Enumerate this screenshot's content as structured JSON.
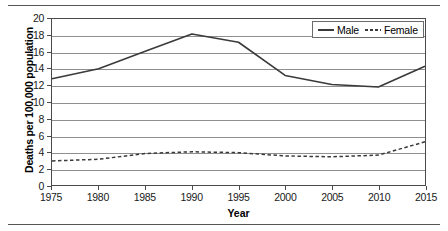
{
  "page": {
    "top_rule": "",
    "bottom_rule": ""
  },
  "chart_data": {
    "type": "line",
    "title": "",
    "xlabel": "Year",
    "ylabel": "Deaths per 100,000 population",
    "xlim": [
      1975,
      2015
    ],
    "ylim": [
      0,
      20
    ],
    "ytick_step": 2,
    "xtick_step": 5,
    "grid": true,
    "legend_position": "top-right",
    "ticks": {
      "y": [
        "0",
        "2",
        "4",
        "6",
        "8",
        "10",
        "12",
        "14",
        "16",
        "18",
        "20"
      ],
      "x": [
        "1975",
        "1980",
        "1985",
        "1990",
        "1995",
        "2000",
        "2005",
        "2010",
        "2015"
      ]
    },
    "x": [
      1975,
      1980,
      1985,
      1990,
      1995,
      2000,
      2005,
      2010,
      2015
    ],
    "series": [
      {
        "name": "Male",
        "style": "solid",
        "color": "#3a3a3a",
        "values": [
          12.8,
          14.0,
          16.1,
          18.2,
          17.2,
          13.2,
          12.1,
          11.8,
          14.3
        ]
      },
      {
        "name": "Female",
        "style": "dashed",
        "color": "#3a3a3a",
        "values": [
          2.9,
          3.1,
          3.8,
          4.0,
          3.9,
          3.5,
          3.4,
          3.6,
          5.2
        ]
      }
    ]
  },
  "legend": {
    "entries": [
      {
        "label": "Male"
      },
      {
        "label": "Female"
      }
    ]
  }
}
